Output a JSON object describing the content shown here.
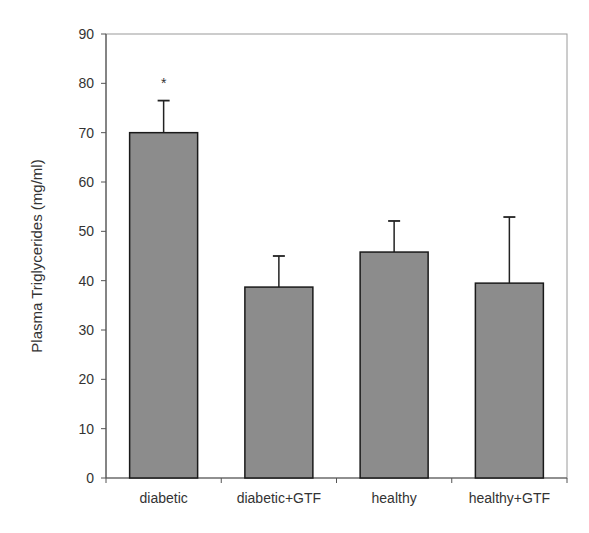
{
  "chart_data": {
    "type": "bar",
    "title": "",
    "xlabel": "",
    "ylabel": "Plasma Triglycerides (mg/ml)",
    "categories": [
      "diabetic",
      "diabetic+GTF",
      "healthy",
      "healthy+GTF"
    ],
    "values": [
      70.0,
      38.7,
      45.8,
      39.5
    ],
    "error_upper": [
      76.5,
      45.0,
      52.1,
      52.9
    ],
    "error_sd": [
      6.5,
      6.3,
      6.3,
      13.4
    ],
    "annotations": [
      {
        "category": "diabetic",
        "text": "*"
      }
    ],
    "ylim": [
      0,
      90
    ],
    "yticks": [
      0,
      10,
      20,
      30,
      40,
      50,
      60,
      70,
      80,
      90
    ],
    "grid": false,
    "legend": null,
    "bar_color": "#8c8c8c",
    "bar_edge_color": "#1a1a1a"
  }
}
